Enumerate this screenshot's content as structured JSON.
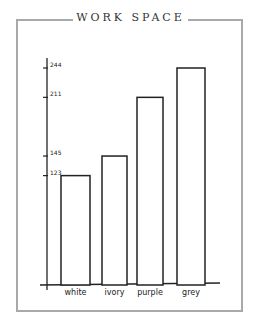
{
  "title": "WORK SPACE",
  "chart_data": {
    "type": "bar",
    "title": "WORK SPACE",
    "categories": [
      "white",
      "ivory",
      "purple",
      "grey"
    ],
    "values": [
      123,
      145,
      211,
      244
    ],
    "yticks": [
      123,
      145,
      211,
      244
    ],
    "xlabel": "",
    "ylabel": "",
    "ylim": [
      0,
      260
    ],
    "grid": false,
    "legend": null
  },
  "colors": {
    "frame": "#a9a9a9",
    "ink": "#222222",
    "bar_fill": "#ffffff"
  }
}
